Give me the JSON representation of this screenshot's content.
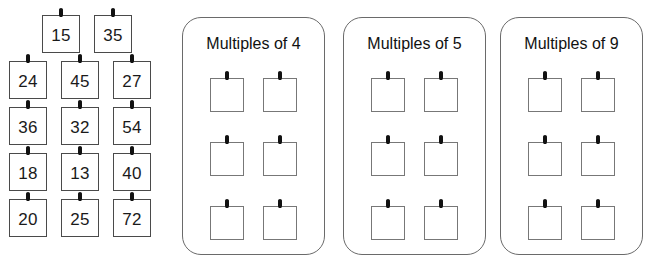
{
  "worksheet": {
    "type": "sorting-activity",
    "title_visible": false,
    "number_pool": {
      "rows": [
        {
          "offset": true,
          "tiles": [
            {
              "value": "15"
            },
            {
              "value": "35"
            }
          ]
        },
        {
          "offset": false,
          "tiles": [
            {
              "value": "24"
            },
            {
              "value": "45"
            },
            {
              "value": "27"
            }
          ]
        },
        {
          "offset": false,
          "tiles": [
            {
              "value": "36"
            },
            {
              "value": "32"
            },
            {
              "value": "54"
            }
          ]
        },
        {
          "offset": false,
          "tiles": [
            {
              "value": "18"
            },
            {
              "value": "13"
            },
            {
              "value": "40"
            }
          ]
        },
        {
          "offset": false,
          "tiles": [
            {
              "value": "20"
            },
            {
              "value": "25"
            },
            {
              "value": "72"
            }
          ]
        }
      ],
      "all_values": [
        "15",
        "35",
        "24",
        "45",
        "27",
        "36",
        "32",
        "54",
        "18",
        "13",
        "40",
        "20",
        "25",
        "72"
      ]
    },
    "panels": [
      {
        "title": "Multiples of 4",
        "slots": [
          {
            "value": ""
          },
          {
            "value": ""
          },
          {
            "value": ""
          },
          {
            "value": ""
          },
          {
            "value": ""
          },
          {
            "value": ""
          }
        ]
      },
      {
        "title": "Multiples of 5",
        "slots": [
          {
            "value": ""
          },
          {
            "value": ""
          },
          {
            "value": ""
          },
          {
            "value": ""
          },
          {
            "value": ""
          },
          {
            "value": ""
          }
        ]
      },
      {
        "title": "Multiples of 9",
        "slots": [
          {
            "value": ""
          },
          {
            "value": ""
          },
          {
            "value": ""
          },
          {
            "value": ""
          },
          {
            "value": ""
          },
          {
            "value": ""
          }
        ]
      }
    ],
    "colors": {
      "background": "#ffffff",
      "tile_border": "#4a4a4a",
      "panel_border": "#6a6a6a",
      "slot_border": "#777777",
      "text": "#111111",
      "pin": "#111111"
    }
  }
}
